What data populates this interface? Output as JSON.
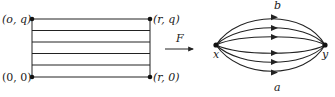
{
  "left_figure": {
    "corner_labels": {
      "top_left": "(o, q)",
      "bottom_left": "(0, 0)",
      "top_right": "(r, q)",
      "bottom_right": "(r, 0)"
    },
    "horizontal_line_count": 6
  },
  "map_arrow": {
    "label": "F"
  },
  "right_figure": {
    "source_node": "x",
    "target_node": "y",
    "top_path_label": "b",
    "bottom_path_label": "a",
    "path_count": 6
  },
  "colors": {
    "ink": "#222222",
    "background": "#ffffff"
  }
}
